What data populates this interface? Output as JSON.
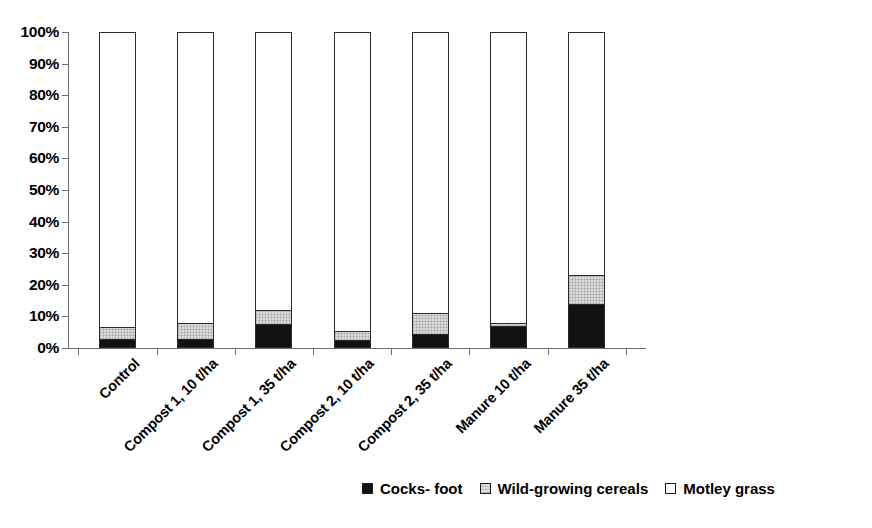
{
  "chart_data": {
    "type": "bar",
    "stacked": true,
    "stack_mode": "percent",
    "title": "",
    "subtitle": "",
    "xlabel": "",
    "ylabel": "",
    "ylim": [
      0,
      100
    ],
    "yticks": [
      "0%",
      "10%",
      "20%",
      "30%",
      "40%",
      "50%",
      "60%",
      "70%",
      "80%",
      "90%",
      "100%"
    ],
    "ytick_values": [
      0,
      10,
      20,
      30,
      40,
      50,
      60,
      70,
      80,
      90,
      100
    ],
    "grid": false,
    "legend_position": "bottom-right",
    "categories": [
      "Control",
      "Compost 1, 10 t/ha",
      "Compost 1, 35 t/ha",
      "Compost 2, 10 t/ha",
      "Compost 2, 35 t/ha",
      "Manure 10 t/ha",
      "Manure 35 t/ha"
    ],
    "series": [
      {
        "name": "Cocks- foot",
        "color": "#121212",
        "values": [
          3,
          3,
          7.5,
          2.5,
          4.5,
          7,
          14
        ]
      },
      {
        "name": "Wild-growing cereals",
        "color": "#dcdcdc",
        "values": [
          3.5,
          5,
          4.5,
          3,
          6.5,
          1,
          9
        ]
      },
      {
        "name": "Motley grass",
        "color": "#ffffff",
        "values": [
          93.5,
          92,
          88,
          94.5,
          89,
          92,
          77
        ]
      }
    ]
  },
  "legend": {
    "items": [
      {
        "label": "Cocks- foot",
        "swatch": "black"
      },
      {
        "label": "Wild-growing cereals",
        "swatch": "gray"
      },
      {
        "label": "Motley grass",
        "swatch": "white"
      }
    ]
  }
}
